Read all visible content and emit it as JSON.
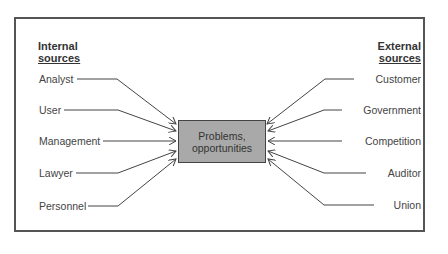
{
  "diagram": {
    "center": {
      "line1": "Problems,",
      "line2": "opportunities"
    },
    "internal": {
      "heading_line1": "Internal",
      "heading_line2": "sources",
      "items": [
        "Analyst",
        "User",
        "Management",
        "Lawyer",
        "Personnel"
      ]
    },
    "external": {
      "heading_line1": "External",
      "heading_line2": "sources",
      "items": [
        "Customer",
        "Government",
        "Competition",
        "Auditor",
        "Union"
      ]
    },
    "colors": {
      "box_fill": "#a9a9a9",
      "line": "#444444",
      "frame": "#555555"
    }
  }
}
